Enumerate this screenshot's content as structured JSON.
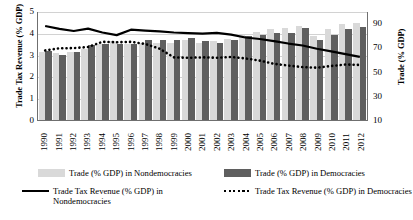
{
  "chart_data": {
    "type": "bar",
    "title": "",
    "xlabel": "",
    "ylabel": "Trade Tax Revenue (% GDP)",
    "y2label": "Trade (% GDP)",
    "ylim": [
      0,
      5
    ],
    "y2lim": [
      10,
      100
    ],
    "grid": true,
    "legend_position": "bottom",
    "categories": [
      "1990",
      "1991",
      "1992",
      "1993",
      "1994",
      "1995",
      "1996",
      "1997",
      "1998",
      "1999",
      "2000",
      "2001",
      "2002",
      "2003",
      "2004",
      "2005",
      "2006",
      "2007",
      "2008",
      "2009",
      "2010",
      "2011",
      "2012"
    ],
    "yticks": [
      "0",
      "1",
      "2",
      "3",
      "4",
      "5"
    ],
    "y2ticks": [
      "10",
      "30",
      "50",
      "70",
      "90"
    ],
    "series": [
      {
        "name": "Trade (% GDP) in Nondemocracies",
        "type": "bar",
        "axis": "right",
        "color": "#d9d9d9",
        "values": [
          66,
          65,
          66,
          69,
          73,
          75,
          73,
          74,
          74,
          74,
          76,
          74,
          75,
          77,
          80,
          83,
          85,
          86,
          88,
          79,
          85,
          89,
          90
        ]
      },
      {
        "name": "Trade (% GDP) in Democracies",
        "type": "bar",
        "axis": "right",
        "color": "#5f5f5f",
        "values": [
          67,
          64,
          66,
          72,
          73,
          73,
          73,
          76,
          76,
          76,
          78,
          75,
          74,
          76,
          79,
          80,
          82,
          82,
          86,
          76,
          80,
          85,
          87
        ]
      },
      {
        "name": "Trade Tax Revenue (% GDP) in Nondemocracies",
        "type": "line",
        "axis": "left",
        "style": "solid",
        "color": "#000000",
        "values": [
          4.35,
          4.22,
          4.12,
          4.23,
          4.05,
          3.93,
          4.18,
          4.14,
          4.1,
          4.05,
          4.02,
          4.0,
          4.03,
          3.95,
          3.82,
          3.75,
          3.65,
          3.54,
          3.45,
          3.3,
          3.18,
          3.05,
          2.92
        ]
      },
      {
        "name": "Trade Tax Revenue (% GDP) in Democracies",
        "type": "line",
        "axis": "left",
        "style": "dotted",
        "color": "#000000",
        "values": [
          3.22,
          3.32,
          3.33,
          3.38,
          3.62,
          3.6,
          3.62,
          3.52,
          3.3,
          2.9,
          2.88,
          2.9,
          2.88,
          2.92,
          2.85,
          2.75,
          2.6,
          2.52,
          2.45,
          2.42,
          2.5,
          2.57,
          2.55
        ]
      }
    ]
  },
  "axes": {
    "left_title": "Trade Tax Revenue (% GDP)",
    "right_title": "Trade (% GDP)"
  },
  "legend": {
    "items": [
      {
        "key": "bar-nondemocracies",
        "label": "Trade (% GDP) in Nondemocracies"
      },
      {
        "key": "line-nondemocracies",
        "label": "Trade Tax Revenue (% GDP) in Nondemocracies"
      },
      {
        "key": "bar-democracies",
        "label": "Trade (% GDP) in Democracies"
      },
      {
        "key": "line-democracies",
        "label": "Trade Tax Revenue (% GDP) in Democracies"
      }
    ]
  }
}
